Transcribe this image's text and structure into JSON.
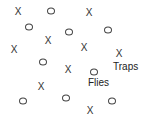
{
  "diagram": {
    "labels": {
      "traps": {
        "text": "Traps",
        "x": 113,
        "y": 62
      },
      "flies": {
        "text": "Flies",
        "x": 88,
        "y": 78
      }
    },
    "traps": [
      {
        "x": 18,
        "y": 12
      },
      {
        "x": 89,
        "y": 13
      },
      {
        "x": 48,
        "y": 41
      },
      {
        "x": 14,
        "y": 50
      },
      {
        "x": 84,
        "y": 48
      },
      {
        "x": 119,
        "y": 54
      },
      {
        "x": 68,
        "y": 70
      },
      {
        "x": 41,
        "y": 87
      },
      {
        "x": 90,
        "y": 111
      }
    ],
    "flies": [
      {
        "x": 51,
        "y": 11
      },
      {
        "x": 29,
        "y": 27
      },
      {
        "x": 69,
        "y": 32
      },
      {
        "x": 108,
        "y": 30
      },
      {
        "x": 43,
        "y": 62
      },
      {
        "x": 94,
        "y": 72
      },
      {
        "x": 23,
        "y": 101
      },
      {
        "x": 66,
        "y": 98
      },
      {
        "x": 112,
        "y": 101
      }
    ],
    "trap_symbol": "X",
    "fly_symbol": "O"
  }
}
